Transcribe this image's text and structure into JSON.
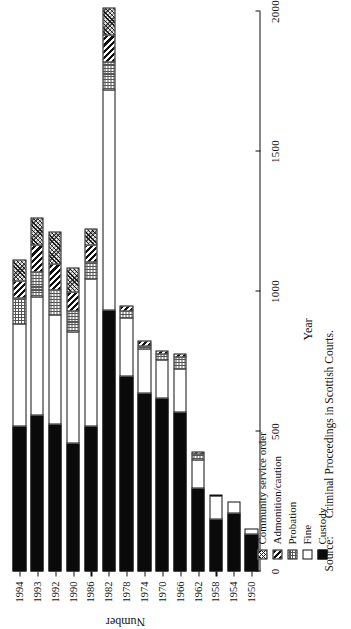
{
  "figure": {
    "xlabel": "Year",
    "ylabel": "Number",
    "source_word": "Source:",
    "source_text": "Criminal Proceedings in Scottish Courts."
  },
  "legend": {
    "items": [
      {
        "label": "Community service order",
        "pattern": "cso",
        "swatch": "crosshatch-fine"
      },
      {
        "label": "Admonition/caution",
        "pattern": "adm",
        "swatch": "diagonal-stripe"
      },
      {
        "label": "Probation",
        "pattern": "prob",
        "swatch": "dotted-grid"
      },
      {
        "label": "Fine",
        "pattern": "fine",
        "swatch": "white"
      },
      {
        "label": "Custody",
        "pattern": "cust",
        "swatch": "black"
      }
    ]
  },
  "chart_data": {
    "type": "bar",
    "orientation": "horizontal",
    "stacked": true,
    "title": "",
    "xlabel": "Year",
    "ylabel": "Number",
    "ylim": [
      0,
      2000
    ],
    "yticks": [
      0,
      500,
      1000,
      1500,
      2000
    ],
    "ytick_labels": [
      "0",
      "500",
      "1000",
      "1500",
      "2000"
    ],
    "grid": false,
    "legend_position": "bottom-left",
    "categories": [
      "1950",
      "1954",
      "1958",
      "1962",
      "1966",
      "1970",
      "1974",
      "1978",
      "1982",
      "1986",
      "1990",
      "1992",
      "1993",
      "1994"
    ],
    "series": [
      {
        "name": "Custody",
        "key": "cust",
        "values": [
          135,
          210,
          190,
          300,
          570,
          620,
          640,
          700,
          935,
          520,
          460,
          530,
          560,
          520
        ]
      },
      {
        "name": "Fine",
        "key": "fine",
        "values": [
          22,
          45,
          85,
          105,
          160,
          140,
          160,
          210,
          790,
          530,
          400,
          390,
          425,
          370
        ]
      },
      {
        "name": "Probation",
        "key": "prob",
        "values": [
          0,
          0,
          5,
          25,
          45,
          25,
          15,
          30,
          105,
          65,
          80,
          95,
          95,
          95
        ]
      },
      {
        "name": "Admonition/caution",
        "key": "adm",
        "values": [
          0,
          0,
          0,
          10,
          15,
          15,
          20,
          20,
          100,
          65,
          70,
          95,
          100,
          65
        ]
      },
      {
        "name": "Community service order",
        "key": "cso",
        "values": [
          0,
          0,
          0,
          0,
          0,
          0,
          0,
          0,
          100,
          60,
          90,
          120,
          100,
          80
        ]
      }
    ],
    "totals": [
      157,
      255,
      280,
      440,
      790,
      800,
      835,
      960,
      2030,
      1240,
      1100,
      1230,
      1280,
      1130
    ],
    "source": "Criminal Proceedings in Scottish Courts."
  }
}
